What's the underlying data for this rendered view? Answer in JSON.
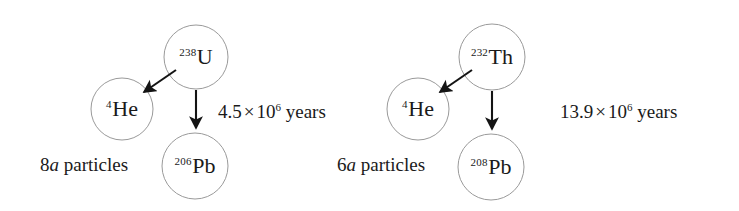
{
  "figure": {
    "type": "radioactive-decay-diagram",
    "background_color": "#ffffff",
    "circle_stroke_color": "#9a9a9a",
    "arrow_color": "#141414",
    "text_color": "#1a1a1a"
  },
  "chains": [
    {
      "id": "uranium-238-chain",
      "parent": {
        "mass_number": "238",
        "symbol": "U",
        "cx": 196,
        "cy": 57,
        "r": 32
      },
      "alpha_product": {
        "mass_number": "4",
        "symbol": "He",
        "cx": 122,
        "cy": 109,
        "r": 31
      },
      "daughter": {
        "mass_number": "206",
        "symbol": "Pb",
        "cx": 195,
        "cy": 166,
        "r": 33
      },
      "half_life": {
        "coefficient": "4.5",
        "times": "×",
        "base": "10",
        "exponent": "6",
        "unit": "years",
        "x": 218,
        "y": 102
      },
      "particle_count": {
        "count": "8",
        "particle": "a",
        "label": "particles",
        "x": 40,
        "y": 155
      }
    },
    {
      "id": "thorium-232-chain",
      "parent": {
        "mass_number": "232",
        "symbol": "Th",
        "cx": 492,
        "cy": 57,
        "r": 33
      },
      "alpha_product": {
        "mass_number": "4",
        "symbol": "He",
        "cx": 418,
        "cy": 109,
        "r": 31
      },
      "daughter": {
        "mass_number": "208",
        "symbol": "Pb",
        "cx": 491,
        "cy": 167,
        "r": 33
      },
      "half_life": {
        "coefficient": "13.9",
        "times": "×",
        "base": "10",
        "exponent": "6",
        "unit": "years",
        "x": 560,
        "y": 102
      },
      "particle_count": {
        "count": "6",
        "particle": "a",
        "label": "particles",
        "x": 337,
        "y": 155
      }
    }
  ]
}
